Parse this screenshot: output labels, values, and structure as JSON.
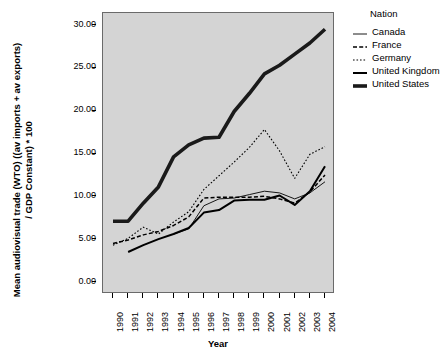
{
  "chart_data": {
    "type": "line",
    "title": "",
    "xlabel": "Year",
    "ylabel": "Mean audiovisual trade (WTO) ((av imports + av exports) / GDP Constant) * 100",
    "ylabel_line1": "Mean audiovisual trade (WTO) ((av imports + av exports)",
    "ylabel_line2": "/ GDP  Constant) * 100",
    "legend_title": "Nation",
    "legend_position": "right",
    "grid": false,
    "panel_color": "#d4d4d4",
    "x": [
      1990,
      1991,
      1992,
      1993,
      1994,
      1995,
      1996,
      1997,
      1998,
      1999,
      2000,
      2001,
      2002,
      2003,
      2004
    ],
    "categories": [
      "1990",
      "1991",
      "1992",
      "1993",
      "1994",
      "1995",
      "1996",
      "1997",
      "1998",
      "1999",
      "2000",
      "2001",
      "2002",
      "2003",
      "2004"
    ],
    "xlim": [
      1990,
      2004
    ],
    "ylim": [
      0,
      30
    ],
    "yticks": [
      0,
      5,
      10,
      15,
      20,
      25,
      30
    ],
    "ytick_labels": [
      "0.00",
      "5.00",
      "10.00",
      "15.00",
      "20.00",
      "25.00",
      "30.00"
    ],
    "series": [
      {
        "name": "Canada",
        "style": "solid-thin",
        "color": "#000000",
        "width": 0.9,
        "values": [
          null,
          null,
          null,
          null,
          5.6,
          6.2,
          8.9,
          9.7,
          9.8,
          10.2,
          10.6,
          10.4,
          9.7,
          10.4,
          11.7
        ]
      },
      {
        "name": "France",
        "style": "dashed",
        "color": "#000000",
        "width": 1.5,
        "values": [
          4.5,
          4.9,
          5.5,
          5.9,
          6.6,
          7.6,
          9.8,
          9.9,
          9.9,
          9.9,
          10.0,
          9.7,
          9.2,
          10.5,
          12.5
        ]
      },
      {
        "name": "Germany",
        "style": "dotted",
        "color": "#000000",
        "width": 1.1,
        "values": [
          4.3,
          5.1,
          6.4,
          5.6,
          7.0,
          8.2,
          10.8,
          12.4,
          14.0,
          15.7,
          17.8,
          15.3,
          12.1,
          14.9,
          15.8
        ]
      },
      {
        "name": "United Kingdom",
        "style": "solid-medium",
        "color": "#000000",
        "width": 2.0,
        "values": [
          null,
          3.5,
          4.3,
          5.0,
          5.6,
          6.3,
          8.1,
          8.4,
          9.5,
          9.6,
          9.6,
          10.1,
          9.0,
          10.6,
          13.5
        ]
      },
      {
        "name": "United States",
        "style": "solid-thick",
        "color": "#1a1a1a",
        "width": 3.6,
        "values": [
          7.1,
          7.1,
          9.2,
          11.1,
          14.6,
          16.0,
          16.8,
          16.9,
          19.9,
          22.0,
          24.3,
          25.3,
          26.6,
          27.9,
          29.5
        ]
      }
    ]
  },
  "legend": {
    "title": "Nation",
    "items": [
      {
        "label": "Canada",
        "key": "solid-thin"
      },
      {
        "label": "France",
        "key": "dashed"
      },
      {
        "label": "Germany",
        "key": "dotted"
      },
      {
        "label": "United Kingdom",
        "key": "solid-medium"
      },
      {
        "label": "United States",
        "key": "solid-thick"
      }
    ]
  },
  "axes": {
    "x_title": "Year",
    "y_title_line1": "Mean audiovisual trade (WTO) ((av imports + av exports)",
    "y_title_line2": "/ GDP  Constant) * 100"
  }
}
